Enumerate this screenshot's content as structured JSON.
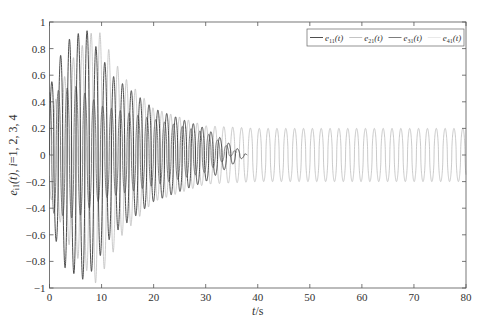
{
  "chart_data": {
    "type": "line",
    "title": "",
    "xlabel": "t/s",
    "ylabel": "e_i1(t), i=1, 2, 3, 4",
    "xlim": [
      0,
      80
    ],
    "ylim": [
      -1,
      1
    ],
    "xticks": [
      0,
      10,
      20,
      30,
      40,
      50,
      60,
      70,
      80
    ],
    "yticks": [
      -1,
      -0.8,
      -0.6,
      -0.4,
      -0.2,
      0,
      0.2,
      0.4,
      0.6,
      0.8,
      1
    ],
    "ytick_labels": [
      "−1",
      "−0.8",
      "−0.6",
      "−0.4",
      "−0.2",
      "0",
      "0.2",
      "0.4",
      "0.6",
      "0.8",
      "1"
    ],
    "grid": false,
    "legend_position": "upper right",
    "period": 1.7,
    "series": [
      {
        "name": "e11(t)",
        "label_main": "e",
        "label_sub": "11",
        "color": "#3a3a3a",
        "width": 0.9,
        "description": "large oscillation, peak ~0.95 near t=7, decays to ~0.2 amplitude around t=30 then fades out",
        "envelope": [
          [
            0,
            0.5
          ],
          [
            3,
            0.85
          ],
          [
            7,
            0.95
          ],
          [
            12,
            0.6
          ],
          [
            20,
            0.35
          ],
          [
            30,
            0.2
          ],
          [
            34,
            0.1
          ],
          [
            38,
            0.0
          ]
        ],
        "offset": 0.0
      },
      {
        "name": "e21(t)",
        "label_main": "e",
        "label_sub": "21",
        "color": "#bdbdbd",
        "width": 0.8,
        "description": "light gray, peak ~0.97 near t=9, persistent oscillation ~±0.2 up to t=80",
        "envelope": [
          [
            0,
            0.3
          ],
          [
            4,
            0.7
          ],
          [
            9,
            0.97
          ],
          [
            14,
            0.6
          ],
          [
            20,
            0.35
          ],
          [
            30,
            0.22
          ],
          [
            40,
            0.2
          ],
          [
            80,
            0.2
          ]
        ],
        "offset": 0.0
      },
      {
        "name": "e31(t)",
        "label_main": "e",
        "label_sub": "31",
        "color": "#6e6e6e",
        "width": 0.9,
        "description": "mid gray, peak ~0.45 early, decays to ~0.15 by t=30",
        "envelope": [
          [
            0,
            0.45
          ],
          [
            5,
            0.5
          ],
          [
            10,
            0.35
          ],
          [
            20,
            0.25
          ],
          [
            30,
            0.15
          ],
          [
            36,
            0.0
          ]
        ],
        "offset": 0.02
      },
      {
        "name": "e41(t)",
        "label_main": "e",
        "label_sub": "41",
        "color": "#e6e6e6",
        "width": 0.6,
        "description": "nearly invisible very light series",
        "envelope": [
          [
            0,
            0.1
          ],
          [
            10,
            0.05
          ],
          [
            20,
            0.0
          ]
        ],
        "offset": 0.0
      }
    ]
  }
}
